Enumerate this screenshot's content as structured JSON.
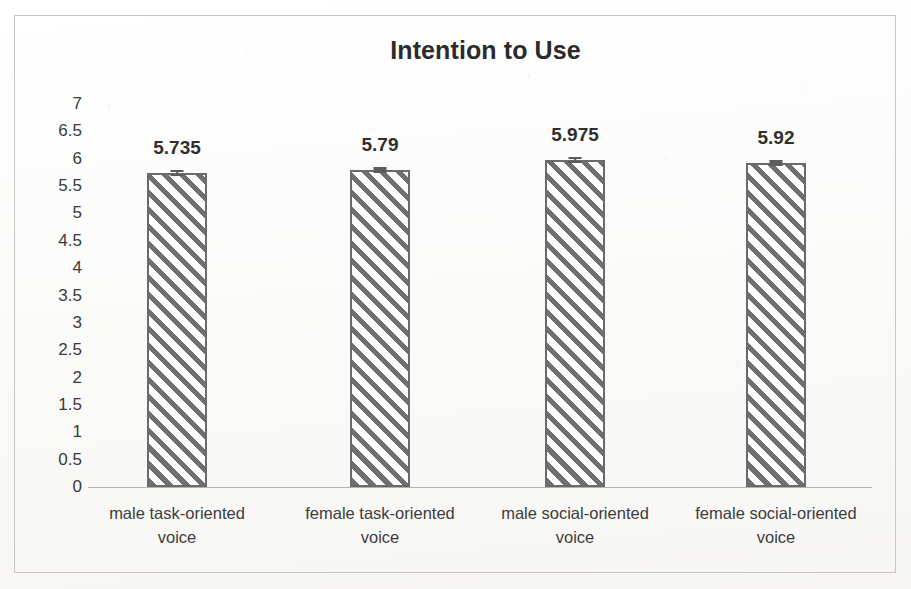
{
  "chart_data": {
    "type": "bar",
    "title": "Intention to Use",
    "xlabel": "",
    "ylabel": "",
    "ylim": [
      0,
      7
    ],
    "grid": false,
    "legend": null,
    "categories": [
      "male task-oriented voice",
      "female task-oriented voice",
      "male social-oriented voice",
      "female social-oriented voice"
    ],
    "category_lines": [
      [
        "male task-oriented",
        "voice"
      ],
      [
        "female task-oriented",
        "voice"
      ],
      [
        "male social-oriented",
        "voice"
      ],
      [
        "female social-oriented",
        "voice"
      ]
    ],
    "values": [
      5.735,
      5.79,
      5.975,
      5.92
    ],
    "value_labels": [
      "5.735",
      "5.79",
      "5.975",
      "5.92"
    ],
    "error_bars": [
      0.06,
      0.05,
      0.06,
      0.05
    ],
    "y_ticks": [
      "7",
      "6.5",
      "6",
      "5.5",
      "5",
      "4.5",
      "4",
      "3.5",
      "3",
      "2.5",
      "2",
      "1.5",
      "1",
      "0.5",
      "0"
    ],
    "y_tick_values": [
      7,
      6.5,
      6,
      5.5,
      5,
      4.5,
      4,
      3.5,
      3,
      2.5,
      2,
      1.5,
      1,
      0.5,
      0
    ],
    "bar_style": "diagonal-hatch",
    "colors": {
      "bar_border": "#6a6a6a",
      "bar_hatch": "#6f6f6f",
      "bar_fill": "#ffffff",
      "title_text": "#2b2b2b",
      "tick_text": "#3a3a3a",
      "axis_line": "#b4b1ac",
      "frame_border": "#c9c6c2",
      "page_background": "#fdfdfc"
    }
  }
}
